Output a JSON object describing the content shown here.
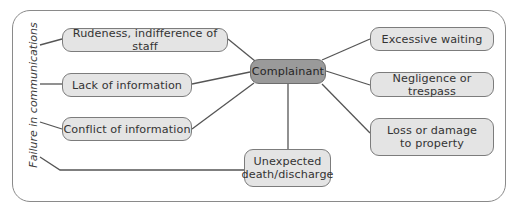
{
  "diagram": {
    "type": "mind-map",
    "center": {
      "label": "Complainant",
      "fill": "#9a9a9a"
    },
    "side_label": "Failure in communications",
    "nodes": [
      {
        "id": "rudeness",
        "label": "Rudeness, indifference of staff"
      },
      {
        "id": "lack-info",
        "label": "Lack of information"
      },
      {
        "id": "conflict-info",
        "label": "Conflict of information"
      },
      {
        "id": "unexpected",
        "label": "Unexpected death/discharge",
        "lines": [
          "Unexpected",
          "death/discharge"
        ]
      },
      {
        "id": "waiting",
        "label": "Excessive waiting"
      },
      {
        "id": "negligence",
        "label": "Negligence or trespass"
      },
      {
        "id": "loss",
        "label": "Loss or damage to property",
        "lines": [
          "Loss or damage",
          "to property"
        ]
      }
    ],
    "edges": [
      [
        "Complainant",
        "Rudeness, indifference of staff"
      ],
      [
        "Complainant",
        "Lack of information"
      ],
      [
        "Complainant",
        "Conflict of information"
      ],
      [
        "Complainant",
        "Unexpected death/discharge"
      ],
      [
        "Complainant",
        "Excessive waiting"
      ],
      [
        "Complainant",
        "Negligence or trespass"
      ],
      [
        "Complainant",
        "Loss or damage to property"
      ],
      [
        "Failure in communications",
        "Rudeness, indifference of staff"
      ],
      [
        "Failure in communications",
        "Lack of information"
      ],
      [
        "Failure in communications",
        "Conflict of information"
      ],
      [
        "Failure in communications",
        "Unexpected death/discharge"
      ]
    ],
    "colors": {
      "node_fill": "#e4e4e4",
      "center_fill": "#9a9a9a",
      "line": "#555555",
      "frame": "#8a8a8a"
    }
  }
}
